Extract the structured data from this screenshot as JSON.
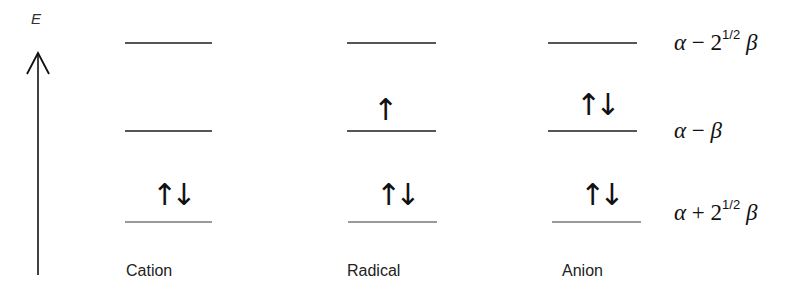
{
  "axis": {
    "label": "E",
    "direction": "up"
  },
  "energy_levels": [
    {
      "id": "top",
      "label_prefix": "α",
      "label_op": " − 2",
      "label_sup": "1/2",
      "label_suffix": "β",
      "y": 43
    },
    {
      "id": "mid",
      "label_prefix": "α",
      "label_op": " − ",
      "label_sup": "",
      "label_suffix": "β",
      "y": 131
    },
    {
      "id": "bottom",
      "label_prefix": "α",
      "label_op": " + 2",
      "label_sup": "1/2",
      "label_suffix": "β",
      "y": 222
    }
  ],
  "species": [
    {
      "name": "Cation",
      "occupancy": {
        "top": "",
        "mid": "",
        "bottom": "↑↓"
      }
    },
    {
      "name": "Radical",
      "occupancy": {
        "top": "",
        "mid": "↑",
        "bottom": "↑↓"
      }
    },
    {
      "name": "Anion",
      "occupancy": {
        "top": "",
        "mid": "↑↓",
        "bottom": "↑↓"
      }
    }
  ]
}
